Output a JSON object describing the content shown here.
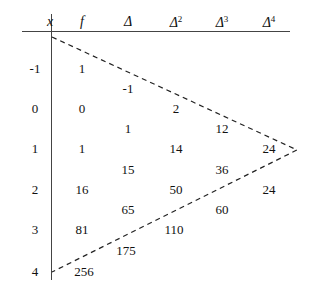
{
  "figure": {
    "kind": "finite-difference-table",
    "headers": [
      {
        "id": "x",
        "label": "x",
        "sup": "",
        "cx": 50,
        "cy": 21
      },
      {
        "id": "f",
        "label": "f",
        "sup": "",
        "cx": 82,
        "cy": 21
      },
      {
        "id": "d1",
        "label": "Δ",
        "sup": "",
        "cx": 128,
        "cy": 21
      },
      {
        "id": "d2",
        "label": "Δ",
        "sup": "2",
        "cx": 176,
        "cy": 21
      },
      {
        "id": "d3",
        "label": "Δ",
        "sup": "3",
        "cx": 222,
        "cy": 21
      },
      {
        "id": "d4",
        "label": "Δ",
        "sup": "4",
        "cx": 269,
        "cy": 21
      }
    ],
    "x_values": [
      {
        "value": "-1",
        "cx": 35,
        "cy": 68
      },
      {
        "value": "0",
        "cx": 35,
        "cy": 108
      },
      {
        "value": "1",
        "cx": 35,
        "cy": 148
      },
      {
        "value": "2",
        "cx": 35,
        "cy": 189
      },
      {
        "value": "3",
        "cx": 35,
        "cy": 229
      },
      {
        "value": "4",
        "cx": 35,
        "cy": 271
      }
    ],
    "f_values": [
      {
        "value": "1",
        "cx": 82,
        "cy": 68
      },
      {
        "value": "0",
        "cx": 82,
        "cy": 108
      },
      {
        "value": "1",
        "cx": 82,
        "cy": 148
      },
      {
        "value": "16",
        "cx": 82,
        "cy": 189
      },
      {
        "value": "81",
        "cx": 82,
        "cy": 229
      },
      {
        "value": "256",
        "cx": 84,
        "cy": 271
      }
    ],
    "delta1_values": [
      {
        "value": "-1",
        "cx": 128,
        "cy": 88
      },
      {
        "value": "1",
        "cx": 128,
        "cy": 128
      },
      {
        "value": "15",
        "cx": 128,
        "cy": 169
      },
      {
        "value": "65",
        "cx": 128,
        "cy": 209
      },
      {
        "value": "175",
        "cx": 126,
        "cy": 250
      }
    ],
    "delta2_values": [
      {
        "value": "2",
        "cx": 176,
        "cy": 108
      },
      {
        "value": "14",
        "cx": 176,
        "cy": 148
      },
      {
        "value": "50",
        "cx": 176,
        "cy": 189
      },
      {
        "value": "110",
        "cx": 174,
        "cy": 229
      }
    ],
    "delta3_values": [
      {
        "value": "12",
        "cx": 222,
        "cy": 128
      },
      {
        "value": "36",
        "cx": 222,
        "cy": 169
      },
      {
        "value": "60",
        "cx": 222,
        "cy": 209
      }
    ],
    "delta4_values": [
      {
        "value": "24",
        "cx": 269,
        "cy": 148
      },
      {
        "value": "24",
        "cx": 269,
        "cy": 189
      }
    ],
    "triangle": {
      "apex_x": 297,
      "apex_y": 150,
      "top_x": 52,
      "top_y": 37,
      "bottom_x": 52,
      "bottom_y": 272,
      "color": "#222222",
      "dash": "5,4"
    }
  },
  "chart_data": {
    "type": "table",
    "title": "",
    "columns": [
      "x",
      "f",
      "Δ",
      "Δ²",
      "Δ³",
      "Δ⁴"
    ],
    "x": [
      -1,
      0,
      1,
      2,
      3,
      4
    ],
    "f": [
      1,
      0,
      1,
      16,
      81,
      256
    ],
    "delta1": [
      -1,
      1,
      15,
      65,
      175
    ],
    "delta2": [
      2,
      14,
      50,
      110
    ],
    "delta3": [
      12,
      36,
      60
    ],
    "delta4": [
      24,
      24
    ]
  }
}
